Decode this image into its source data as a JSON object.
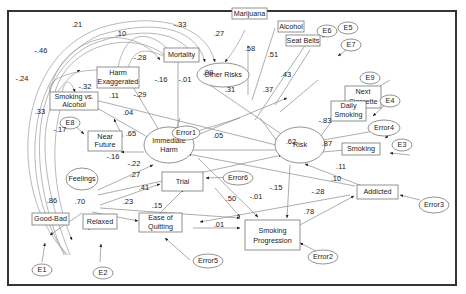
{
  "diagram": {
    "type": "structural equation model path diagram",
    "nodes": {
      "marijuana": "Marijuana",
      "alcohol": "Alcohol",
      "seat_belts": "Seat Belts",
      "mortality": "Mortality",
      "other_risks": "Other Risks",
      "harm_exaggerated_1": "Harm",
      "harm_exaggerated_2": "Exaggerated",
      "smoking_vs_alcohol_1": "Smoking vs.",
      "smoking_vs_alcohol_2": "Alcohol",
      "next_cigarette_1": "Next",
      "next_cigarette_2": "Cigarette",
      "daily_smoking_1": "Daily",
      "daily_smoking_2": "Smoking",
      "near_future_1": "Near",
      "near_future_2": "Future",
      "immediate_harm_1": "Immediate",
      "immediate_harm_2": "Harm",
      "risk": "Risk",
      "smoking": "Smoking",
      "feelings": "Feelings",
      "trial": "Trial",
      "addicted": "Addicted",
      "good_bad": "Good-Bad",
      "relaxed": "Relaxed",
      "ease_of_quitting_1": "Ease of",
      "ease_of_quitting_2": "Quitting",
      "smoking_progression_1": "Smoking",
      "smoking_progression_2": "Progression"
    },
    "errors": {
      "e1": "E1",
      "e2": "E2",
      "e3": "E3",
      "e4": "E4",
      "e5": "E5",
      "e6": "E6",
      "e7": "E7",
      "e8": "E8",
      "e9": "E9",
      "error1": "Error1",
      "error2": "Error2",
      "error3": "Error3",
      "error4": "Error4",
      "error5": "Error5",
      "error6": "Error6"
    },
    "coefficients": {
      "c_21": ".21",
      "c_10": ".10",
      "c_neg46": "-.46",
      "c_neg33": "-.33",
      "c_27_top": ".27",
      "c_neg28_top": "-.28",
      "c_neg24": "-.24",
      "c_neg32": "-.32",
      "c_neg16_harm": "-.16",
      "c_neg01_mort": "-.01",
      "c_09": ".09",
      "c_58": ".58",
      "c_51": ".51",
      "c_43": ".43",
      "c_31": ".31",
      "c_37": ".37",
      "c_neg29": "-.29",
      "c_11_sva": ".11",
      "c_04": ".04",
      "c_33": ".33",
      "c_neg17": "-.17",
      "c_65": ".65",
      "c_62": ".62",
      "c_neg83": "-.83",
      "c_05": ".05",
      "c_87": ".87",
      "c_neg16_feel": "-.16",
      "c_neg22": "-.22",
      "c_27_trial": ".27",
      "c_41": ".41",
      "c_11_add": ".11",
      "c_10_add": ".10",
      "c_neg28_add": "-.28",
      "c_86": ".86",
      "c_70": ".70",
      "c_23": ".23",
      "c_15_ease": ".15",
      "c_50": ".50",
      "c_neg01_prog": "-.01",
      "c_neg15": "-.15",
      "c_78": ".78",
      "c_01": ".01"
    }
  }
}
